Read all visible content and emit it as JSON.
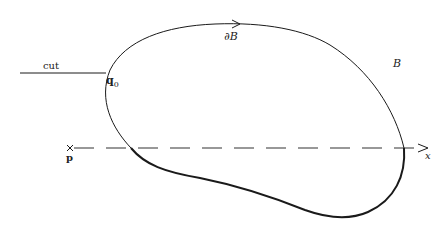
{
  "figure": {
    "region_label": "B",
    "boundary_label": "∂B",
    "cut_label": "cut",
    "point_q": {
      "symbol": "q",
      "subscript": "0"
    },
    "point_p": "p",
    "axis_label": "x"
  },
  "colors": {
    "stroke": "#1a1a1a",
    "background": "#ffffff"
  }
}
